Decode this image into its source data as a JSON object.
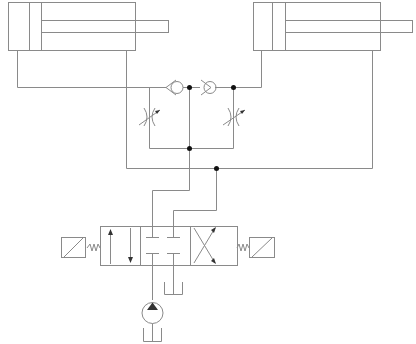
{
  "diagram": {
    "type": "hydraulic-circuit",
    "colors": {
      "line": "#8a8a8a",
      "junction": "#111111",
      "background": "#ffffff"
    },
    "components": [
      {
        "id": "cylinder-left",
        "kind": "double-acting-cylinder"
      },
      {
        "id": "cylinder-right",
        "kind": "double-acting-cylinder"
      },
      {
        "id": "check-valve-left",
        "kind": "check-valve"
      },
      {
        "id": "check-valve-right",
        "kind": "check-valve"
      },
      {
        "id": "throttle-valve-left",
        "kind": "adjustable-throttle-valve"
      },
      {
        "id": "throttle-valve-right",
        "kind": "adjustable-throttle-valve"
      },
      {
        "id": "directional-valve",
        "kind": "4/3-solenoid-directional-valve-spring-centered"
      },
      {
        "id": "solenoid-left",
        "kind": "solenoid-actuator"
      },
      {
        "id": "solenoid-right",
        "kind": "solenoid-actuator"
      },
      {
        "id": "pump",
        "kind": "hydraulic-pump"
      },
      {
        "id": "tank-valve",
        "kind": "tank"
      },
      {
        "id": "tank-pump",
        "kind": "tank"
      }
    ],
    "junctions": 5
  }
}
